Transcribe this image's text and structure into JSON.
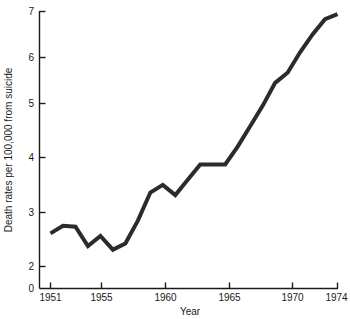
{
  "chart_data": {
    "type": "line",
    "title": "",
    "subtitle": "",
    "xlabel": "Year",
    "ylabel": "Death rates per 100,000 from suicide",
    "x": [
      1951,
      1952,
      1953,
      1954,
      1955,
      1956,
      1957,
      1958,
      1959,
      1960,
      1961,
      1962,
      1963,
      1964,
      1965,
      1966,
      1967,
      1968,
      1969,
      1970,
      1971,
      1972,
      1973,
      1974
    ],
    "values": [
      2.65,
      2.8,
      2.78,
      2.4,
      2.6,
      2.33,
      2.45,
      2.9,
      3.45,
      3.6,
      3.4,
      3.7,
      4.0,
      4.0,
      4.0,
      4.35,
      4.75,
      5.15,
      5.6,
      5.8,
      6.2,
      6.55,
      6.85,
      6.95
    ],
    "series": [
      {
        "name": "Death rate from suicide",
        "values": [
          2.65,
          2.8,
          2.78,
          2.4,
          2.6,
          2.33,
          2.45,
          2.9,
          3.45,
          3.6,
          3.4,
          3.7,
          4.0,
          4.0,
          4.0,
          4.35,
          4.75,
          5.15,
          5.6,
          5.8,
          6.2,
          6.55,
          6.85,
          6.95
        ],
        "color": "#2b2b2b",
        "line_width": 4,
        "markers": "none"
      }
    ],
    "xlim": [
      1950.6,
      1974.4
    ],
    "ylim": [
      0,
      7
    ],
    "xticks": [
      1951,
      1955,
      1960,
      1965,
      1970,
      1974
    ],
    "xticklabels": [
      "1951",
      "1955",
      "1960",
      "1965",
      "1970",
      "1974"
    ],
    "yticks": [
      0,
      2,
      3,
      4,
      5,
      6,
      7
    ],
    "yticklabels": [
      "0",
      "2",
      "3",
      "4",
      "5",
      "6",
      "7"
    ],
    "y_axis_broken": true,
    "y_axis_break_note": "axis compressed between 0 and 2; no tick at 1",
    "grid": false,
    "legend": "none",
    "annotations": []
  },
  "axes": {
    "x_title": "Year",
    "y_title": "Death rates per 100,000 from suicide"
  },
  "ticks": {
    "x": [
      {
        "label": "1951"
      },
      {
        "label": "1955"
      },
      {
        "label": "1960"
      },
      {
        "label": "1965"
      },
      {
        "label": "1970"
      },
      {
        "label": "1974"
      }
    ],
    "y": [
      {
        "label": "7"
      },
      {
        "label": "6"
      },
      {
        "label": "5"
      },
      {
        "label": "4"
      },
      {
        "label": "3"
      },
      {
        "label": "2"
      },
      {
        "label": "0"
      }
    ]
  },
  "style": {
    "line_color": "#2b2b2b",
    "axis_color": "#1a1a1a",
    "background": "#ffffff"
  }
}
